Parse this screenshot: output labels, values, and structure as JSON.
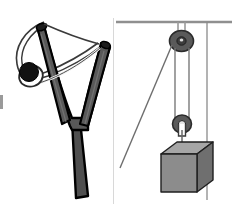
{
  "figure": {
    "background_color": "#ffffff",
    "width": 234,
    "height": 208,
    "panel_count": 2
  },
  "panels": [
    {
      "id": "slingshot",
      "name": "Slingshot with ball",
      "position": "left",
      "objects": [
        {
          "name": "y-frame",
          "label": "slingshot frame",
          "color": "#595959",
          "outline": "#000000"
        },
        {
          "name": "left-prong",
          "label": "left prong",
          "color": "#595959"
        },
        {
          "name": "right-prong",
          "label": "right prong",
          "color": "#595959"
        },
        {
          "name": "handle",
          "label": "handle",
          "color": "#4f4f4f"
        },
        {
          "name": "elastic-band",
          "label": "elastic band",
          "color": "#f2f2f2",
          "outline": "#3a3a3a"
        },
        {
          "name": "pouch",
          "label": "pouch",
          "color": "#ffffff",
          "outline": "#2a2a2a"
        },
        {
          "name": "ball",
          "label": "projectile ball",
          "color": "#111111"
        }
      ]
    },
    {
      "id": "pulley",
      "name": "Pulley system with hanging block",
      "position": "right",
      "objects": [
        {
          "name": "ceiling",
          "label": "ceiling support",
          "color": "#8f8f8f"
        },
        {
          "name": "fixed-pulley",
          "label": "fixed pulley",
          "color": "#5a5a5a",
          "outline": "#2b2b2b"
        },
        {
          "name": "fixed-pulley-bracket",
          "label": "fixed pulley bracket",
          "color": "#9a9a9a"
        },
        {
          "name": "movable-pulley",
          "label": "movable pulley",
          "color": "#5a5a5a",
          "outline": "#2b2b2b"
        },
        {
          "name": "pull-rope",
          "label": "free end of rope",
          "color": "#6e6e6e"
        },
        {
          "name": "rope-left-segment",
          "label": "rope left segment",
          "color": "#7a7a7a"
        },
        {
          "name": "rope-right-segment",
          "label": "rope right segment",
          "color": "#7a7a7a"
        },
        {
          "name": "anchor-rope",
          "label": "anchored rope",
          "color": "#8a8a8a"
        },
        {
          "name": "hook",
          "label": "hook",
          "color": "#ffffff",
          "outline": "#3a3a3a"
        },
        {
          "name": "block",
          "label": "hanging block",
          "color_front": "#8c8c8c",
          "color_top": "#a6a6a6",
          "color_side": "#6f6f6f",
          "outline": "#1f1f1f"
        }
      ]
    }
  ],
  "colors": {
    "frame_gray": "#595959",
    "frame_dark": "#4f4f4f",
    "outline_black": "#000000",
    "ball_black": "#111111",
    "rope_gray": "#7a7a7a",
    "ceiling_gray": "#8f8f8f",
    "pulley_gray": "#5a5a5a",
    "block_front": "#8c8c8c",
    "block_top": "#a6a6a6",
    "block_side": "#6f6f6f",
    "divider_gray": "#d8d8d8",
    "edge_mark_gray": "#9a9a9a"
  }
}
